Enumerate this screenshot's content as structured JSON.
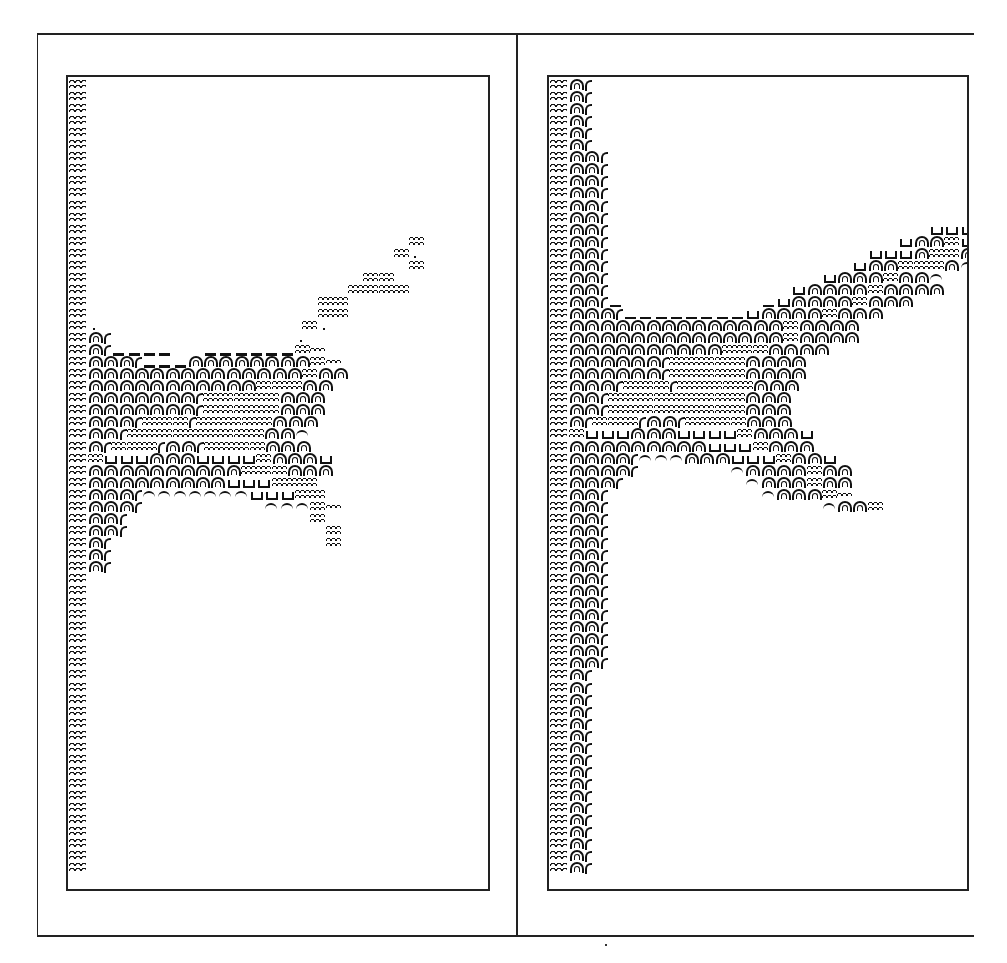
{
  "figure": {
    "legend_glyphs": {
      "edge": "water wave (boundary column)",
      "A": "land arch cell",
      "P": "partial land cell (arch edge)",
      "D": "shoreline dash",
      "W": "open water double wave",
      "w": "single wave",
      "u": "cup glyph (shallow/marsh cell)",
      "t": "arch-top fragment",
      "d": "dot/tick",
      ".": "blank"
    },
    "cell": {
      "row_pitch_px": 12.05,
      "col_pitch_px": 15.3,
      "edge_col_px": 20
    },
    "panels": [
      {
        "id": "left",
        "label": "",
        "rows": [
          "E",
          "E",
          "E",
          "E",
          "E",
          "E",
          "E",
          "E",
          "E",
          "E",
          "E",
          "E",
          "E",
          "E.....................W",
          "E....................Wd",
          "E.....................W",
          "E..................WW",
          "E.................WWWW",
          "E...............WW",
          "E...............WW",
          "Ed.............Wd",
          "EAP............d",
          "EAPDDDD..DDDDDDWw",
          "EAAAPDDDAAAAAAAAWw",
          "EAAAAAAAAAAAAAAWAA",
          "EAAAAAAAAAAAWWWAA",
          "EAAAAAAAPWWWWWAAA",
          "EAAAAAAAPWWWWWAAA",
          "EAAAPWWWPWWWWWAAA",
          "EAAPWWWWWWWWWAAt",
          "EAPWWWPAAPWWWWAAA",
          "EWuuuAAAuuuuWAAAu",
          "EAAAAAAAAAAWWWAAA",
          "EAAAAAAAAAuuuWWW",
          "EAAAPtttttttuuuWW",
          "EAAAP........tttWw",
          "EAAP............W",
          "EAAP.............W",
          "EAP..............W",
          "EAP",
          "EAP",
          "E",
          "E",
          "E",
          "E",
          "E",
          "E",
          "E",
          "E",
          "E",
          "E",
          "E",
          "E",
          "E",
          "E",
          "E",
          "E",
          "E",
          "E",
          "E",
          "E",
          "E",
          "E",
          "E",
          "E",
          "E"
        ]
      },
      {
        "id": "right",
        "label": "",
        "rows": [
          "EAP",
          "EAP",
          "EAP",
          "EAP",
          "EAP",
          "EAP",
          "EAAP",
          "EAAP",
          "EAAP",
          "EAAP",
          "EAAP",
          "EAAP",
          "EAAP.....................uuuuw",
          "EAAP...................uAAWuu",
          "EAAP.................uuuAWWAuA",
          "EAAP................uAAWWWAt",
          "EAAP..............uAAAWAAt",
          "EAAP............uAAAAWAAAA",
          "EAAPD.........DuAAAAWAAA",
          "EAAAPDDDDDDDDuAAAAWAAA",
          "EAAAAAAAAAAAAAAWAAAA",
          "EAAAAAAAAAAAAAAWAAAA",
          "EAAAAAAAAAAWWWAAAA",
          "EAAAAAAPWWWWWAAAA",
          "EAAAAAAPWWWWWAAAA",
          "EAAAPWWWPWWWWWAAA",
          "EAAPWWWWWWWWWAAA",
          "EAAPWWWWWWWWWAAA",
          "EAPWWWPAAPWWWWAAA",
          "EWuuuAAAuuuuWAAAu",
          "EAAAAAAAAAuuuWAAA",
          "EAAAAPtttAAAuuuWAAu",
          "EAAAAP......tAAAAWAA",
          "EAAAP........tAAAWAA",
          "EAAP..........tAAAWw",
          "EAAP..............tAAW",
          "EAAP",
          "EAAP",
          "EAAP",
          "EAAP",
          "EAAP",
          "EAAP",
          "EAAP",
          "EAAP",
          "EAAP",
          "EAAP",
          "EAAP",
          "EAAP",
          "EAAP",
          "EAP",
          "EAP",
          "EAP",
          "EAP",
          "EAP",
          "EAP",
          "EAP",
          "EAP",
          "EAP",
          "EAP",
          "EAP",
          "EAP",
          "EAP",
          "EAP",
          "EAP",
          "EAP",
          "EAP"
        ]
      }
    ]
  }
}
